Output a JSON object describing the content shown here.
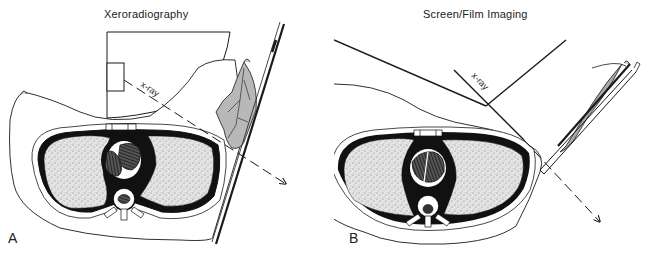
{
  "panels": [
    {
      "label": "A",
      "title": "Xeroradiography",
      "beam_label": "x-ray"
    },
    {
      "label": "B",
      "title": "Screen/Film Imaging",
      "beam_label": "x-ray"
    }
  ],
  "colors": {
    "ink": "#1a1a1a",
    "lung_fill": "#d9d9d9",
    "breast_tissue": "#bdbdbd",
    "background": "#ffffff"
  }
}
